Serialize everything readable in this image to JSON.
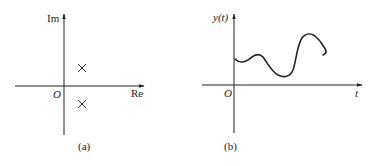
{
  "panels": [
    {
      "id": "a",
      "caption": "(a)",
      "x_axis_label": "Re",
      "y_axis_label": "Im",
      "origin_label": "O",
      "markers": [
        {
          "type": "cross",
          "position": "upper-right of origin"
        },
        {
          "type": "cross",
          "position": "lower-right of origin"
        }
      ]
    },
    {
      "id": "b",
      "caption": "(b)",
      "x_axis_label": "t",
      "y_axis_label": "y(t)",
      "origin_label": "O",
      "curve": "smooth oscillating signal y(t) for t > 0"
    }
  ],
  "colors": {
    "ink": "#222222",
    "background": "#ffffff"
  }
}
